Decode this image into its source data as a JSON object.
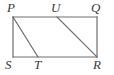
{
  "figure": {
    "background_color": "#ffffff",
    "stroke_color": "#6e6e6e",
    "label_color": "#3a3a3a",
    "stroke_width": 1.2,
    "canvas": {
      "width": 114,
      "height": 75
    },
    "vertices": [
      {
        "id": "P",
        "label": "P",
        "x": 13,
        "y": 17,
        "label_position": "above-left"
      },
      {
        "id": "U",
        "label": "U",
        "x": 57,
        "y": 17,
        "label_position": "above"
      },
      {
        "id": "Q",
        "label": "Q",
        "x": 97,
        "y": 17,
        "label_position": "above-right"
      },
      {
        "id": "S",
        "label": "S",
        "x": 13,
        "y": 57,
        "label_position": "below-left"
      },
      {
        "id": "T",
        "label": "T",
        "x": 38,
        "y": 57,
        "label_position": "below"
      },
      {
        "id": "R",
        "label": "R",
        "x": 97,
        "y": 57,
        "label_position": "below-right"
      }
    ],
    "segments": [
      {
        "id": "PQ",
        "from": "P",
        "to": "Q",
        "x1": 13,
        "y1": 17,
        "x2": 97,
        "y2": 17,
        "role": "top-side"
      },
      {
        "id": "QR",
        "from": "Q",
        "to": "R",
        "x1": 97,
        "y1": 17,
        "x2": 97,
        "y2": 57,
        "role": "right-side"
      },
      {
        "id": "RS",
        "from": "R",
        "to": "S",
        "x1": 97,
        "y1": 57,
        "x2": 13,
        "y2": 57,
        "role": "bottom-side"
      },
      {
        "id": "SP",
        "from": "S",
        "to": "P",
        "x1": 13,
        "y1": 57,
        "x2": 13,
        "y2": 17,
        "role": "left-side"
      },
      {
        "id": "PT",
        "from": "P",
        "to": "T",
        "x1": 13,
        "y1": 17,
        "x2": 38,
        "y2": 57,
        "role": "transversal"
      },
      {
        "id": "UR",
        "from": "U",
        "to": "R",
        "x1": 57,
        "y1": 17,
        "x2": 97,
        "y2": 57,
        "role": "transversal"
      }
    ]
  }
}
